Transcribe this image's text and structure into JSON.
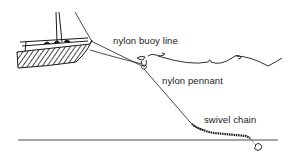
{
  "diagram": {
    "labels": {
      "buoy_line": "nylon buoy line",
      "pennant": "nylon pennant",
      "chain": "swivel chain"
    },
    "components": [
      "boat",
      "buoy",
      "surface-wave",
      "pennant-line",
      "chain",
      "seabed",
      "anchor"
    ],
    "colors": {
      "ink": "#1a1a1a",
      "background": "#ffffff"
    }
  }
}
